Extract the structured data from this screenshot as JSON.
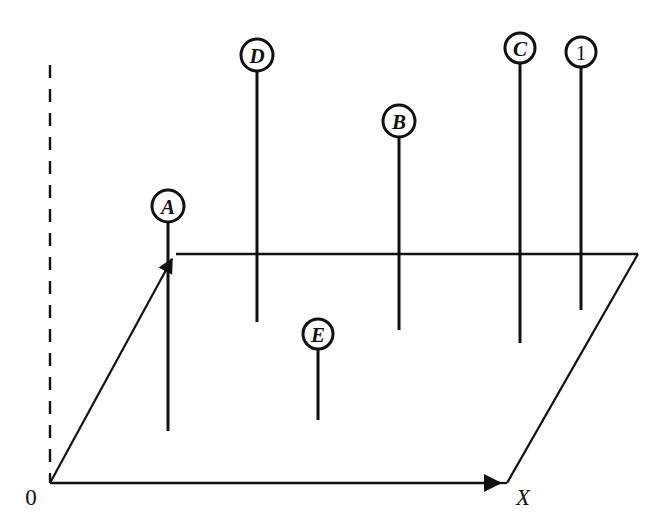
{
  "figure": {
    "type": "technical-line-diagram",
    "background_color": "#ffffff",
    "stroke_color": "#111111",
    "canvas": {
      "width": 665,
      "height": 529
    }
  },
  "axes": {
    "x_axis": {
      "label": "X",
      "label_x": 523,
      "label_y": 497,
      "style": "solid",
      "arrow": true,
      "from_x": 50,
      "from_y": 483,
      "to_x": 507,
      "to_y": 483
    },
    "z_axis": {
      "label": "",
      "style": "dashed",
      "from_x": 50,
      "from_y": 65,
      "to_x": 50,
      "to_y": 483
    },
    "y_axis": {
      "label": "",
      "style": "solid",
      "arrow": true,
      "from_x": 50,
      "from_y": 483,
      "to_x": 176,
      "to_y": 254
    },
    "origin": {
      "label": "0",
      "label_x": 31,
      "label_y": 497,
      "point_x": 50,
      "point_y": 483
    }
  },
  "ground_plane": {
    "name": "perspective-parallelogram",
    "points": [
      {
        "x": 50,
        "y": 483
      },
      {
        "x": 507,
        "y": 483
      },
      {
        "x": 638,
        "y": 254
      },
      {
        "x": 176,
        "y": 254
      }
    ],
    "path": "M 50 483 L 507 483 L 638 254 L 176 254 Z"
  },
  "markers": [
    {
      "id": "marker-a",
      "label": "A",
      "numeric": false,
      "circle_cx": 168,
      "circle_cy": 206,
      "circle_r": 16,
      "stem_x": 168,
      "stem_top_y": 222,
      "stem_bottom_y": 431
    },
    {
      "id": "marker-d",
      "label": "D",
      "numeric": false,
      "circle_cx": 257,
      "circle_cy": 55,
      "circle_r": 16,
      "stem_x": 257,
      "stem_top_y": 71,
      "stem_bottom_y": 322
    },
    {
      "id": "marker-b",
      "label": "B",
      "numeric": false,
      "circle_cx": 399,
      "circle_cy": 121,
      "circle_r": 16,
      "stem_x": 399,
      "stem_top_y": 137,
      "stem_bottom_y": 330
    },
    {
      "id": "marker-c",
      "label": "C",
      "numeric": false,
      "circle_cx": 520,
      "circle_cy": 48,
      "circle_r": 15,
      "stem_x": 520,
      "stem_top_y": 63,
      "stem_bottom_y": 343
    },
    {
      "id": "marker-1",
      "label": "1",
      "numeric": true,
      "circle_cx": 581,
      "circle_cy": 52,
      "circle_r": 15,
      "stem_x": 581,
      "stem_top_y": 67,
      "stem_bottom_y": 310
    },
    {
      "id": "marker-e",
      "label": "E",
      "numeric": false,
      "circle_cx": 318,
      "circle_cy": 334,
      "circle_r": 15,
      "stem_x": 318,
      "stem_top_y": 349,
      "stem_bottom_y": 420
    }
  ]
}
